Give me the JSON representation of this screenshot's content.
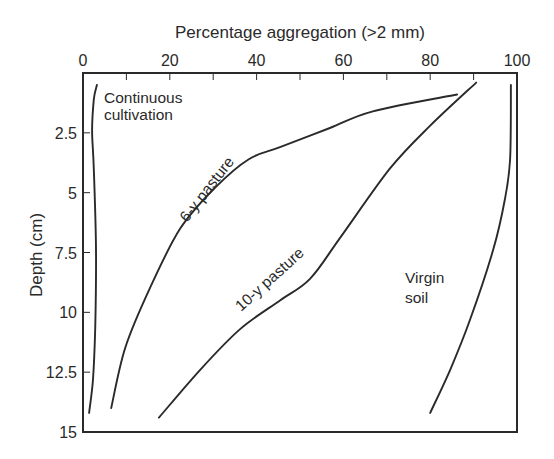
{
  "chart_data": {
    "type": "line",
    "title": "",
    "xlabel": "Percentage aggregation (>2 mm)",
    "ylabel": "Depth (cm)",
    "xlim": [
      0,
      100
    ],
    "ylim": [
      15,
      0
    ],
    "x_axis_position": "top",
    "y_axis_inverted": true,
    "grid": false,
    "legend": "inline labels",
    "x_ticks": [
      0,
      20,
      40,
      60,
      80,
      100
    ],
    "x_tick_labels": [
      "0",
      "20",
      "40",
      "60",
      "80",
      "100"
    ],
    "y_ticks": [
      2.5,
      5,
      7.5,
      10,
      12.5,
      15
    ],
    "y_tick_labels": [
      "2.5",
      "5",
      "7.5",
      "10",
      "12.5",
      "15"
    ],
    "series": [
      {
        "name": "Continuous cultivation",
        "label_lines": [
          "Continuous",
          "cultivation"
        ],
        "points": [
          [
            3.2,
            0.5
          ],
          [
            2.5,
            1.1
          ],
          [
            2.1,
            2.4
          ],
          [
            2.5,
            4.0
          ],
          [
            3.0,
            7.4
          ],
          [
            2.8,
            10.7
          ],
          [
            2.3,
            12.8
          ],
          [
            1.4,
            14.2
          ]
        ]
      },
      {
        "name": "6-y pasture",
        "label_lines": [
          "6-y pasture"
        ],
        "points": [
          [
            86.2,
            0.9
          ],
          [
            66.8,
            1.6
          ],
          [
            56.9,
            2.3
          ],
          [
            45.4,
            3.1
          ],
          [
            38.2,
            3.6
          ],
          [
            30.4,
            4.8
          ],
          [
            22.4,
            6.5
          ],
          [
            15.4,
            9.0
          ],
          [
            9.7,
            11.5
          ],
          [
            6.5,
            14.0
          ]
        ]
      },
      {
        "name": "10-y pasture",
        "label_lines": [
          "10-y pasture"
        ],
        "points": [
          [
            90.6,
            0.4
          ],
          [
            80.0,
            2.2
          ],
          [
            70.7,
            4.0
          ],
          [
            59.2,
            6.9
          ],
          [
            52.3,
            8.6
          ],
          [
            45.4,
            9.5
          ],
          [
            36.2,
            10.7
          ],
          [
            27.0,
            12.4
          ],
          [
            17.5,
            14.4
          ]
        ]
      },
      {
        "name": "Virgin soil",
        "label_lines": [
          "Virgin",
          "soil"
        ],
        "points": [
          [
            98.6,
            0.5
          ],
          [
            98.4,
            3.6
          ],
          [
            97.2,
            5.3
          ],
          [
            94.5,
            7.4
          ],
          [
            89.2,
            10.3
          ],
          [
            84.6,
            12.4
          ],
          [
            80.0,
            14.2
          ]
        ]
      }
    ]
  },
  "plot_box_px": {
    "left": 83,
    "top": 73,
    "right": 517,
    "bottom": 432
  }
}
